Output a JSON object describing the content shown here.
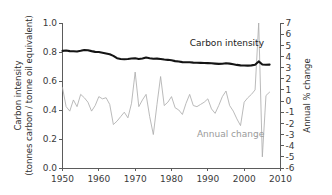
{
  "figure": {
    "background_color": "#ffffff",
    "left_axis_title_line1": "Carbon intensity",
    "left_axis_title_line2": "(tonnes carbon / tonne oil equivalent)",
    "right_axis_title": "Annual % change"
  },
  "chart_data": {
    "type": "line",
    "title": "",
    "xlabel": "",
    "ylabel": "Carbon intensity (tonnes carbon / tonne oil equivalent)",
    "y2label": "Annual % change",
    "grid": false,
    "legend": "inline-annotations",
    "xlim": [
      1950,
      2010
    ],
    "ylim": [
      0.0,
      1.0
    ],
    "y2lim": [
      -6,
      7
    ],
    "xticks": [
      1950,
      1960,
      1970,
      1980,
      1990,
      2000,
      2010
    ],
    "xticklabels": [
      "1950",
      "1960",
      "1970",
      "1980",
      "1990",
      "2000",
      "2010"
    ],
    "yticks": [
      0.0,
      0.2,
      0.4,
      0.6,
      0.8,
      1.0
    ],
    "yticklabels": [
      "0.0",
      "0.2",
      "0.4",
      "0.6",
      "0.8",
      "1.0"
    ],
    "y2ticks": [
      -6,
      -5,
      -4,
      -3,
      -2,
      -1,
      0,
      1,
      2,
      3,
      4,
      5,
      6,
      7
    ],
    "y2ticklabels": [
      "-6",
      "-5",
      "-4",
      "-3",
      "-2",
      "-1",
      "0",
      "1",
      "2",
      "3",
      "4",
      "5",
      "6",
      "7"
    ],
    "annotations": [
      {
        "text": "Carbon intensity",
        "x": 1985.0,
        "y": 0.84,
        "color": "#1a1a1a"
      },
      {
        "text": "Annual change",
        "x": 1987.0,
        "y": 0.215,
        "color": "#9a9a9a"
      }
    ],
    "series": [
      {
        "name": "Carbon intensity",
        "axis": "left",
        "color": "#141414",
        "linewidth": 2.1,
        "x": [
          1950,
          1951,
          1952,
          1953,
          1954,
          1955,
          1956,
          1957,
          1958,
          1959,
          1960,
          1961,
          1962,
          1963,
          1964,
          1965,
          1966,
          1967,
          1968,
          1969,
          1970,
          1971,
          1972,
          1973,
          1974,
          1975,
          1976,
          1977,
          1978,
          1979,
          1980,
          1981,
          1982,
          1983,
          1984,
          1985,
          1986,
          1987,
          1988,
          1989,
          1990,
          1991,
          1992,
          1993,
          1994,
          1995,
          1996,
          1997,
          1998,
          1999,
          2000,
          2001,
          2002,
          2003,
          2004,
          2005,
          2006,
          2007
        ],
        "values": [
          0.808,
          0.81,
          0.806,
          0.805,
          0.803,
          0.808,
          0.814,
          0.812,
          0.806,
          0.801,
          0.8,
          0.795,
          0.79,
          0.784,
          0.773,
          0.757,
          0.752,
          0.75,
          0.752,
          0.755,
          0.757,
          0.752,
          0.755,
          0.762,
          0.757,
          0.753,
          0.754,
          0.752,
          0.748,
          0.746,
          0.743,
          0.737,
          0.734,
          0.73,
          0.729,
          0.729,
          0.727,
          0.726,
          0.725,
          0.724,
          0.723,
          0.722,
          0.72,
          0.718,
          0.719,
          0.722,
          0.72,
          0.716,
          0.711,
          0.708,
          0.707,
          0.706,
          0.708,
          0.712,
          0.735,
          0.714,
          0.712,
          0.713
        ]
      },
      {
        "name": "Annual change",
        "axis": "right",
        "color": "#adadad",
        "linewidth": 0.85,
        "x": [
          1950,
          1951,
          1952,
          1953,
          1954,
          1955,
          1956,
          1957,
          1958,
          1959,
          1960,
          1961,
          1962,
          1963,
          1964,
          1965,
          1966,
          1967,
          1968,
          1969,
          1970,
          1971,
          1972,
          1973,
          1974,
          1975,
          1976,
          1977,
          1978,
          1979,
          1980,
          1981,
          1982,
          1983,
          1984,
          1985,
          1986,
          1987,
          1988,
          1989,
          1990,
          1991,
          1992,
          1993,
          1994,
          1995,
          1996,
          1997,
          1998,
          1999,
          2000,
          2001,
          2002,
          2003,
          2004,
          2005,
          2006,
          2007
        ],
        "values": [
          1.2,
          -0.5,
          -0.9,
          0.1,
          -0.5,
          0.6,
          0.3,
          -0.1,
          -0.9,
          -0.4,
          0.4,
          0.2,
          0.3,
          -0.3,
          -2.1,
          -1.8,
          -1.4,
          -1.0,
          -1.5,
          -0.2,
          2.6,
          -0.5,
          0.1,
          0.6,
          -1.4,
          -3.0,
          -0.3,
          2.2,
          -0.4,
          -0.1,
          0.4,
          -0.6,
          -0.8,
          -1.2,
          -0.2,
          0.6,
          -0.4,
          -0.5,
          -0.3,
          -0.1,
          0.2,
          -0.7,
          -1.1,
          -0.4,
          0.4,
          0.9,
          -0.4,
          -0.9,
          -1.6,
          -2.2,
          -0.1,
          0.3,
          0.6,
          1.0,
          7.0,
          -5.0,
          0.5,
          0.8
        ]
      }
    ]
  }
}
